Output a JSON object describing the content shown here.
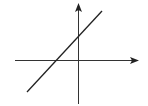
{
  "diagram": {
    "type": "cartesian-axes-with-line",
    "background": "#ffffff",
    "stroke_color": "#222222",
    "x_axis": {
      "y": 60,
      "x_start": 15,
      "x_end": 138,
      "arrow": "right"
    },
    "y_axis": {
      "x": 78,
      "y_start": 104,
      "y_end": 4,
      "arrow": "up"
    },
    "line": {
      "x1": 27,
      "y1": 92,
      "x2": 102,
      "y2": 11,
      "description": "straight line with positive slope crossing negative x-axis and positive y-axis"
    }
  }
}
